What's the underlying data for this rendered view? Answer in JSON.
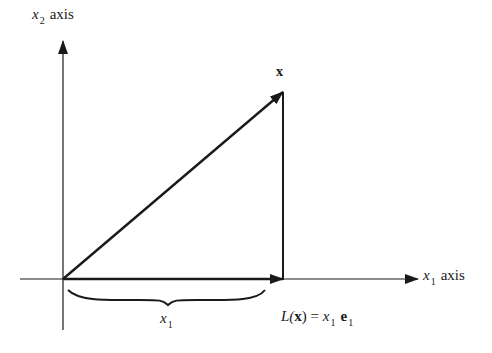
{
  "diagram": {
    "type": "vector projection",
    "colors": {
      "stroke": "#1a1a1a",
      "background": "#ffffff"
    },
    "labels": {
      "x2_axis": {
        "var": "x",
        "sub": "2",
        "word": "axis"
      },
      "x1_axis": {
        "var": "x",
        "sub": "1",
        "word": "axis"
      },
      "vector": "x",
      "brace_label": {
        "var": "x",
        "sub": "1"
      },
      "projection": {
        "fn": "L(",
        "arg": "x",
        "close": ")",
        "eq": " = ",
        "var": "x",
        "sub": "1",
        "basis": "e",
        "basis_sub": "1"
      }
    },
    "geometry": {
      "origin": [
        63,
        279
      ],
      "vector_tip": [
        283,
        92
      ],
      "projection_point": [
        283,
        279
      ]
    }
  }
}
